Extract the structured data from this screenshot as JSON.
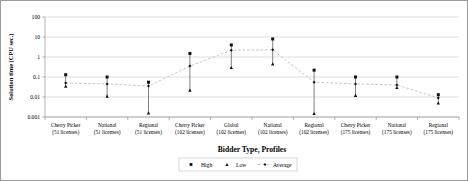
{
  "chart_data": {
    "type": "scatter",
    "title": "",
    "xlabel": "Bidder Type, Profiles",
    "ylabel": "Solution time (CPU sec.)",
    "yscale": "log",
    "ylim": [
      0.001,
      100
    ],
    "ytick_labels": [
      "100",
      "10",
      "1",
      "0.1",
      "0.01",
      "0.001"
    ],
    "ytick_values": [
      100,
      10,
      1,
      0.1,
      0.01,
      0.001
    ],
    "grid": true,
    "legend_position": "bottom",
    "categories": [
      {
        "name": "Cherry Picker",
        "profiles": "(51 licenses)"
      },
      {
        "name": "National",
        "profiles": "(51 licenses)"
      },
      {
        "name": "Regional",
        "profiles": "(51 licenses)"
      },
      {
        "name": "Cherry Picker",
        "profiles": "(102 licenses)"
      },
      {
        "name": "Global",
        "profiles": "(102 licenses)"
      },
      {
        "name": "National",
        "profiles": "(102 licenses)"
      },
      {
        "name": "Regional",
        "profiles": "(102 licenses)"
      },
      {
        "name": "Cherry Picker",
        "profiles": "(175 licenses)"
      },
      {
        "name": "National",
        "profiles": "(175 licenses)"
      },
      {
        "name": "Regional",
        "profiles": "(175 licenses)"
      }
    ],
    "series": [
      {
        "name": "High",
        "marker": "square",
        "values": [
          0.13,
          0.1,
          0.055,
          1.5,
          4.0,
          8.0,
          0.22,
          0.1,
          0.1,
          0.013
        ]
      },
      {
        "name": "Low",
        "marker": "triangle",
        "values": [
          0.035,
          0.011,
          0.0016,
          0.022,
          0.3,
          0.45,
          0.0015,
          0.012,
          0.03,
          0.005
        ]
      },
      {
        "name": "Average",
        "marker": "diamond",
        "values": [
          0.05,
          0.045,
          0.035,
          0.35,
          2.2,
          2.3,
          0.055,
          0.045,
          0.04,
          0.009
        ]
      }
    ]
  },
  "legend": {
    "items": [
      {
        "label": "High"
      },
      {
        "label": "Low"
      },
      {
        "label": "Average"
      }
    ]
  }
}
